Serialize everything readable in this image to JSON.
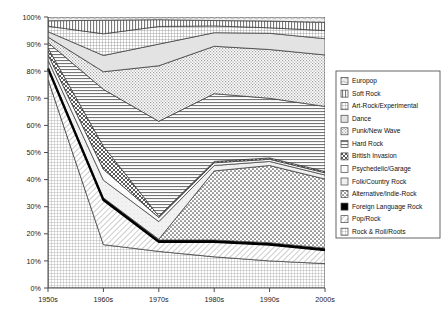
{
  "chart_data": {
    "type": "area",
    "stacked": true,
    "normalized": true,
    "title": "",
    "xlabel": "",
    "ylabel": "",
    "x": [
      "1950s",
      "1960s",
      "1970s",
      "1980s",
      "1990s",
      "2000s"
    ],
    "categories": [
      "1950s",
      "1960s",
      "1970s",
      "1980s",
      "1990s",
      "2000s"
    ],
    "xtick_labels": [
      "1950s",
      "1960s",
      "1970s",
      "1980s",
      "1990s",
      "2000s"
    ],
    "ytick_labels": [
      "0%",
      "10%",
      "20%",
      "30%",
      "40%",
      "50%",
      "60%",
      "70%",
      "80%",
      "90%",
      "100%"
    ],
    "ytick_values": [
      0,
      10,
      20,
      30,
      40,
      50,
      60,
      70,
      80,
      90,
      100
    ],
    "ylim": [
      0,
      100
    ],
    "grid": false,
    "legend_position": "right",
    "stack_order_bottom_to_top": [
      "Rock & Roll/Roots",
      "Pop/Rock",
      "Foreign Language Rock",
      "Alternative/Indie-Rock",
      "Folk/Country Rock",
      "Psychedelic/Garage",
      "British Invasion",
      "Hard Rock",
      "Punk/New Wave",
      "Dance",
      "Art-Rock/Experimental",
      "Soft Rock",
      "Europop"
    ],
    "series": [
      {
        "name": "Rock & Roll/Roots",
        "values": [
          77.0,
          16.0,
          13.5,
          11.5,
          10.0,
          9.0
        ]
      },
      {
        "name": "Pop/Rock",
        "values": [
          4.0,
          16.5,
          3.5,
          5.5,
          6.0,
          5.0
        ]
      },
      {
        "name": "Foreign Language Rock",
        "values": [
          0.6,
          0.8,
          0.7,
          0.7,
          0.7,
          0.7
        ]
      },
      {
        "name": "Alternative/Indie-Rock",
        "values": [
          0.0,
          0.0,
          0.3,
          25.5,
          28.5,
          25.5
        ]
      },
      {
        "name": "Folk/Country Rock",
        "values": [
          2.5,
          6.5,
          6.5,
          2.0,
          1.5,
          1.5
        ]
      },
      {
        "name": "Psychedelic/Garage",
        "values": [
          2.0,
          4.0,
          1.5,
          1.0,
          0.8,
          0.8
        ]
      },
      {
        "name": "British Invasion",
        "values": [
          2.5,
          8.5,
          0.5,
          0.5,
          0.5,
          0.5
        ]
      },
      {
        "name": "Hard Rock",
        "values": [
          2.0,
          21.0,
          35.0,
          25.0,
          22.0,
          24.0
        ]
      },
      {
        "name": "Punk/New Wave",
        "values": [
          2.0,
          6.5,
          20.5,
          17.5,
          18.0,
          19.0
        ]
      },
      {
        "name": "Dance",
        "values": [
          2.0,
          6.0,
          8.0,
          5.0,
          6.0,
          6.0
        ]
      },
      {
        "name": "Art-Rock/Experimental",
        "values": [
          2.0,
          8.0,
          6.5,
          2.5,
          2.0,
          3.0
        ]
      },
      {
        "name": "Soft Rock",
        "values": [
          2.0,
          5.0,
          2.5,
          2.0,
          2.5,
          3.0
        ]
      },
      {
        "name": "Europop",
        "values": [
          1.4,
          1.2,
          1.0,
          1.3,
          1.5,
          2.0
        ]
      }
    ]
  },
  "legend": {
    "items": [
      {
        "label": "Europop"
      },
      {
        "label": "Soft Rock"
      },
      {
        "label": "Art-Rock/Experimental"
      },
      {
        "label": "Dance"
      },
      {
        "label": "Punk/New Wave"
      },
      {
        "label": "Hard Rock"
      },
      {
        "label": "British Invasion"
      },
      {
        "label": "Psychedelic/Garage"
      },
      {
        "label": "Folk/Country Rock"
      },
      {
        "label": "Alternative/Indie-Rock"
      },
      {
        "label": "Foreign Language Rock"
      },
      {
        "label": "Pop/Rock"
      },
      {
        "label": "Rock & Roll/Roots"
      }
    ]
  },
  "axes": {
    "y_labels": [
      "100%",
      "90%",
      "80%",
      "70%",
      "60%",
      "50%",
      "40%",
      "30%",
      "20%",
      "10%",
      "0%"
    ],
    "x_labels": [
      "1950s",
      "1960s",
      "1970s",
      "1980s",
      "1990s",
      "2000s"
    ]
  },
  "colors": {
    "axis": "#4d4d4d",
    "outline": "#333333",
    "background": "#ffffff",
    "emphasis_line": "#000000"
  }
}
